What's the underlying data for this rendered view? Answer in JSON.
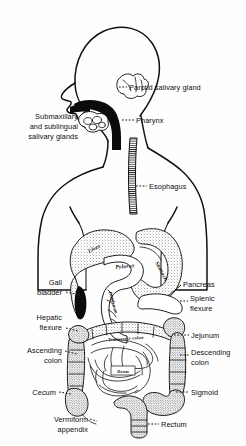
{
  "figure": {
    "background_color": "#fefefe",
    "ink_color": "#111111",
    "style": "black-and-white line art anatomical illustration"
  },
  "callouts_left": [
    {
      "id": "submaxillary",
      "lines": [
        "Submaxillary",
        "and sublingual",
        "salivary glands"
      ],
      "leader": "dashed"
    },
    {
      "id": "gall-bladder",
      "lines": [
        "Gall",
        "bladder"
      ],
      "leader": "dashed"
    },
    {
      "id": "hepatic-flexure",
      "lines": [
        "Hepatic",
        "flexure"
      ],
      "leader": "dashed"
    },
    {
      "id": "ascending-colon",
      "lines": [
        "Ascending",
        "colon"
      ],
      "leader": "dashed"
    },
    {
      "id": "cecum",
      "lines": [
        "Cecum"
      ],
      "leader": "dashed"
    },
    {
      "id": "vermiform-appendix",
      "lines": [
        "Vermiform",
        "appendix"
      ],
      "leader": "dashed"
    }
  ],
  "callouts_right": [
    {
      "id": "parotid-salivary-gland",
      "lines": [
        "Parotid salivary gland"
      ],
      "leader": "dashed"
    },
    {
      "id": "pharynx",
      "lines": [
        "Pharynx"
      ],
      "leader": "dashed"
    },
    {
      "id": "esophagus",
      "lines": [
        "Esophagus"
      ],
      "leader": "dashed"
    },
    {
      "id": "pancreas",
      "lines": [
        "Pancreas"
      ],
      "leader": "solid"
    },
    {
      "id": "splenic-flexure",
      "lines": [
        "Splenic",
        "flexure"
      ],
      "leader": "dashed"
    },
    {
      "id": "jejunum",
      "lines": [
        "Jejunum"
      ],
      "leader": "dashed"
    },
    {
      "id": "descending-colon",
      "lines": [
        "Descending",
        "colon"
      ],
      "leader": "dashed"
    },
    {
      "id": "sigmoid",
      "lines": [
        "Sigmoid"
      ],
      "leader": "dashed"
    },
    {
      "id": "rectum",
      "lines": [
        "Rectum"
      ],
      "leader": "dashed"
    }
  ],
  "organ_labels": [
    {
      "id": "liver",
      "text": "Liver"
    },
    {
      "id": "pylorus",
      "text": "Pylorus"
    },
    {
      "id": "stomach",
      "text": "Stomach"
    },
    {
      "id": "duodenum",
      "text": "Duodenum"
    },
    {
      "id": "transverse-colon",
      "text": "Transverse colon"
    },
    {
      "id": "ileum",
      "text": "Ileum"
    }
  ]
}
